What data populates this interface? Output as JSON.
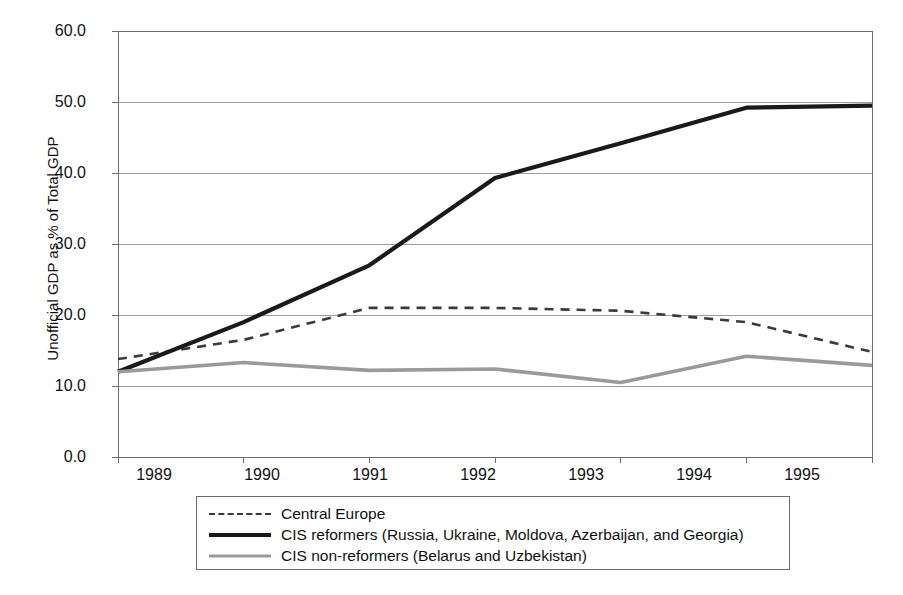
{
  "chart_data": {
    "type": "line",
    "title": "",
    "xlabel": "",
    "ylabel": "Unofficial GDP as % of Total GDP",
    "x": [
      1989,
      1990,
      1991,
      1992,
      1993,
      1994,
      1995
    ],
    "categories": [
      "1989",
      "1990",
      "1991",
      "1992",
      "1993",
      "1994",
      "1995"
    ],
    "xlim": [
      1989,
      1995
    ],
    "ylim": [
      0.0,
      60.0
    ],
    "yticks": [
      0.0,
      10.0,
      20.0,
      30.0,
      40.0,
      50.0,
      60.0
    ],
    "ytick_labels": [
      "0.0",
      "10.0",
      "20.0",
      "30.0",
      "40.0",
      "50.0",
      "60.0"
    ],
    "grid": "horizontal",
    "legend_position": "below-plot",
    "series": [
      {
        "name": "Central Europe",
        "style": "dashed",
        "color": "#3a3a3a",
        "values": [
          13.8,
          16.5,
          21.0,
          21.0,
          20.6,
          19.0,
          14.8
        ]
      },
      {
        "name": "CIS reformers (Russia, Ukraine, Moldova, Azerbaijan, and Georgia)",
        "style": "solid",
        "color": "#1a1a1a",
        "values": [
          12.0,
          19.0,
          27.0,
          39.3,
          44.2,
          49.2,
          49.5
        ]
      },
      {
        "name": "CIS non-reformers (Belarus and Uzbekistan)",
        "style": "solid",
        "color": "#9a9a9a",
        "values": [
          12.0,
          13.3,
          12.2,
          12.4,
          10.5,
          14.2,
          12.9
        ]
      }
    ]
  },
  "legend": {
    "entries": [
      {
        "label": "Central Europe"
      },
      {
        "label": "CIS reformers (Russia, Ukraine, Moldova, Azerbaijan, and Georgia)"
      },
      {
        "label": "CIS non-reformers (Belarus and Uzbekistan)"
      }
    ]
  },
  "plot_geometry": {
    "left": 118,
    "right": 872,
    "top": 31,
    "bottom": 457
  },
  "colors": {
    "axis": "#6c6c6c",
    "grid": "#9d9d9d",
    "background": "#ffffff",
    "text": "#111111"
  }
}
